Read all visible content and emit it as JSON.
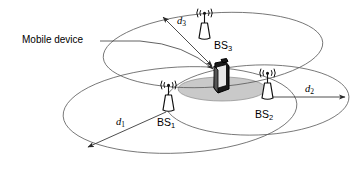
{
  "diagram": {
    "type": "network-coverage-diagram",
    "colors": {
      "background": "#ffffff",
      "cell_outline": "#5a5a5a",
      "overlap_fill": "#c9c9c9",
      "line": "#3a3a3a",
      "device_fill": "#1a1a1a",
      "text": "#000000"
    },
    "callout": {
      "label": "Mobile device",
      "leader_icon": "leader-line-icon"
    },
    "base_stations": [
      {
        "id": "bs1",
        "label": "BS",
        "subscript": "1",
        "icon": "antenna-tower-icon",
        "cell_name": "cell-coverage-ellipse-bs1"
      },
      {
        "id": "bs2",
        "label": "BS",
        "subscript": "2",
        "icon": "antenna-tower-icon",
        "cell_name": "cell-coverage-ellipse-bs2"
      },
      {
        "id": "bs3",
        "label": "BS",
        "subscript": "3",
        "icon": "antenna-tower-icon",
        "cell_name": "cell-coverage-ellipse-bs3"
      }
    ],
    "distances": [
      {
        "id": "d1",
        "label": "d",
        "subscript": "1",
        "from": "bs1",
        "to": "cell-edge",
        "arrow": "single-arrow-icon"
      },
      {
        "id": "d2",
        "label": "d",
        "subscript": "2",
        "from": "bs2",
        "to": "cell-edge",
        "arrow": "single-arrow-icon"
      },
      {
        "id": "d3",
        "label": "d",
        "subscript": "3",
        "from": "cell-edge",
        "to": "mobile-device",
        "arrow": "double-arrow-icon"
      }
    ],
    "mobile_device": {
      "icon": "mobile-phone-icon",
      "region": "overlap-coverage-region"
    }
  }
}
